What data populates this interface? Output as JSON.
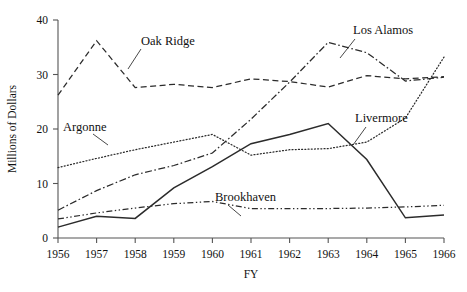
{
  "chart_data": {
    "type": "line",
    "title": "",
    "xlabel": "FY",
    "ylabel": "Millions of Dollars",
    "x": [
      1956,
      1957,
      1958,
      1959,
      1960,
      1961,
      1962,
      1963,
      1964,
      1965,
      1966
    ],
    "xticklabels": [
      "1956",
      "1957",
      "1958",
      "1959",
      "1960",
      "1961",
      "1962",
      "1963",
      "1964",
      "1965",
      "1966"
    ],
    "yticks": [
      0,
      10,
      20,
      30,
      40
    ],
    "yticklabels": [
      "0",
      "10",
      "20",
      "30",
      "40"
    ],
    "xlim": [
      1956,
      1966
    ],
    "ylim": [
      0,
      40
    ],
    "grid": false,
    "legend": "inline-annotations",
    "series": [
      {
        "name": "Oak Ridge",
        "style": "dashed",
        "values": [
          26.2,
          36.2,
          27.6,
          28.2,
          27.6,
          29.2,
          28.7,
          27.7,
          29.8,
          29.2,
          29.6
        ],
        "label_xy": [
          141,
          45
        ],
        "leader": "M 141 49 L 128 69"
      },
      {
        "name": "Argonne",
        "style": "dotted",
        "values": [
          12.9,
          14.6,
          16.2,
          17.6,
          19.0,
          15.2,
          16.2,
          16.4,
          17.6,
          22.0,
          33.2
        ],
        "label_xy": [
          63,
          131
        ],
        "leader": "M 93 134 L 108 145"
      },
      {
        "name": "Los Alamos",
        "style": "dashdot",
        "values": [
          5.1,
          8.7,
          11.6,
          13.3,
          15.6,
          21.8,
          28.6,
          35.9,
          34.0,
          28.8,
          29.5
        ],
        "label_xy": [
          353,
          34
        ],
        "leader": "M 355 39 L 340 58"
      },
      {
        "name": "Livermore",
        "style": "solid",
        "values": [
          2.0,
          4.0,
          3.6,
          9.2,
          13.1,
          17.3,
          19.0,
          21.0,
          14.4,
          3.7,
          4.2
        ],
        "label_xy": [
          355,
          122
        ],
        "leader": "M 366 127 L 353 145"
      },
      {
        "name": "Brookhaven",
        "style": "dashdotdot",
        "values": [
          3.5,
          4.6,
          5.5,
          6.3,
          6.7,
          5.4,
          5.4,
          5.4,
          5.5,
          5.7,
          6.0
        ],
        "label_xy": [
          215,
          201
        ],
        "leader": "M 228 205 L 241 216"
      }
    ]
  }
}
